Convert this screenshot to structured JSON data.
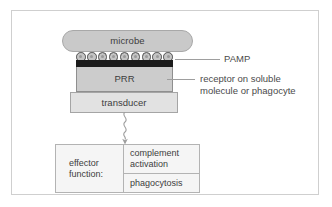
{
  "figure": {
    "colors": {
      "frame_border": "#cfcfcf",
      "microbe_fill": "#c9c9c9",
      "pamp_fill": "#c4c4c4",
      "pamp_stroke": "#4f4f4f",
      "prr_band": "#1b1b1b",
      "prr_fill": "#cccccc",
      "transducer_fill": "#e2e2e2",
      "effector_fill": "#f5f5f5",
      "text": "#3d3d3d",
      "leader_line": "#9e9e9e"
    }
  },
  "diagram": {
    "microbe": {
      "label": "microbe"
    },
    "pamp": {
      "count": 9,
      "annotation_label": "PAMP"
    },
    "prr": {
      "label": "PRR",
      "annotation_lines": [
        "receptor on soluble",
        "molecule or phagocyte"
      ]
    },
    "transducer": {
      "label": "transducer"
    },
    "signal_arrow": {
      "name": "wavy-signal-arrow",
      "direction": "down"
    },
    "effector": {
      "title_lines": [
        "effector",
        "function:"
      ],
      "outcomes": [
        {
          "lines": [
            "complement",
            "activation"
          ]
        },
        {
          "lines": [
            "phagocytosis"
          ]
        }
      ]
    }
  }
}
